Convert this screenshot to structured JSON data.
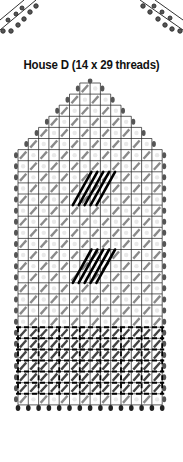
{
  "title": "House D (14 x 29 threads)",
  "chart": {
    "columns": 14,
    "rows": 29,
    "grid": {
      "left": 18,
      "top": 83,
      "cell_w": 10.3,
      "cell_h": 11.1
    },
    "roof_rows": 7,
    "dark_patches": [
      {
        "name": "upper-window",
        "col_start": 6,
        "row_start": 8,
        "cols": 2,
        "rows": 3
      },
      {
        "name": "lower-window",
        "col_start": 6,
        "row_start": 15,
        "cols": 2,
        "rows": 3
      }
    ],
    "border_band": {
      "row_start": 22,
      "rows": 6
    },
    "colors": {
      "grid_line": "#1a1a1a",
      "stitch_light": "#8a8a8a",
      "stitch_dark": "#000000",
      "dot": "#555555",
      "background": "#ffffff"
    }
  },
  "legend": []
}
